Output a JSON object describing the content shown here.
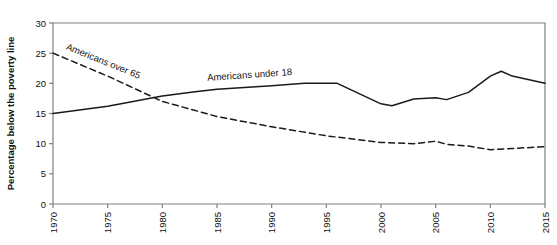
{
  "chart_data": {
    "type": "line",
    "title": "",
    "subtitle": "",
    "xlabel": "",
    "ylabel": "Percentage below the poverty line",
    "xlim": [
      1970,
      2015
    ],
    "ylim": [
      0,
      30
    ],
    "yticks": [
      0,
      5,
      10,
      15,
      20,
      25,
      30
    ],
    "xticks": [
      1970,
      1975,
      1980,
      1985,
      1990,
      1995,
      2000,
      2005,
      2010,
      2015
    ],
    "grid": false,
    "legend": "inline-labels",
    "annotations": [
      {
        "text": "Americans over 65",
        "series": "Americans over 65",
        "x": 1974.5,
        "y": 23.2
      },
      {
        "text": "Americans under 18",
        "series": "Americans under 18",
        "x": 1988.0,
        "y": 20.9
      }
    ],
    "series": [
      {
        "name": "Americans under 18",
        "style": "solid",
        "color": "#1a1a1a",
        "x": [
          1970,
          1975,
          1980,
          1983,
          1985,
          1990,
          1993,
          1996,
          2000,
          2001,
          2003,
          2005,
          2006,
          2008,
          2010,
          2011,
          2012,
          2015
        ],
        "values": [
          15.0,
          16.2,
          17.9,
          18.6,
          19.0,
          19.6,
          20.0,
          20.0,
          16.6,
          16.3,
          17.4,
          17.6,
          17.3,
          18.5,
          21.2,
          22.0,
          21.2,
          20.0
        ]
      },
      {
        "name": "Americans over 65",
        "style": "dashed",
        "color": "#1a1a1a",
        "x": [
          1970,
          1975,
          1980,
          1985,
          1990,
          1995,
          2000,
          2003,
          2005,
          2006,
          2008,
          2010,
          2012,
          2015
        ],
        "values": [
          25.0,
          21.2,
          17.0,
          14.5,
          12.8,
          11.3,
          10.2,
          10.0,
          10.4,
          9.9,
          9.6,
          9.0,
          9.2,
          9.5
        ]
      }
    ]
  },
  "axes": {
    "y_title": "Percentage below the poverty line",
    "y_tick_labels": [
      "0",
      "5",
      "10",
      "15",
      "20",
      "25",
      "30"
    ],
    "x_tick_labels": [
      "1970",
      "1975",
      "1980",
      "1985",
      "1990",
      "1995",
      "2000",
      "2005",
      "2010",
      "2015"
    ]
  },
  "series_labels": {
    "over65": "Americans over 65",
    "under18": "Americans under 18"
  },
  "colors": {
    "line": "#1a1a1a",
    "frame": "#808080",
    "text": "#111111",
    "background": "#ffffff"
  }
}
